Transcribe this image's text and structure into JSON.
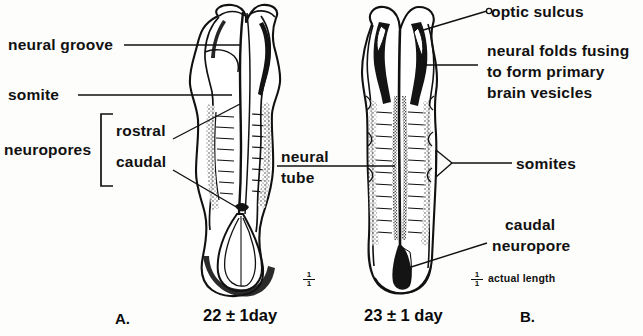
{
  "figure": {
    "panels": [
      {
        "letter": "A.",
        "caption": "22 ± 1day",
        "scale_num": "1",
        "scale_den": "1"
      },
      {
        "letter": "B.",
        "caption": "23 ± 1 day",
        "scale_num": "1",
        "scale_den": "1",
        "scale_note": "actual length"
      }
    ],
    "labels": {
      "neural_groove": "neural groove",
      "somite": "somite",
      "neuropores": "neuropores",
      "rostral": "rostral",
      "caudal": "caudal",
      "neural_tube_line1": "neural",
      "neural_tube_line2": "tube",
      "optic_sulcus": "optic sulcus",
      "neural_folds_line1": "neural folds fusing",
      "neural_folds_line2": "to form primary",
      "neural_folds_line3": "brain vesicles",
      "somites": "somites",
      "caudal_neuropore_line1": "caudal",
      "caudal_neuropore_line2": "neuropore",
      "actual_length": "actual length"
    },
    "colors": {
      "ink": "#111111",
      "paper": "#fdfdfb",
      "fill_dark": "#141414"
    }
  }
}
